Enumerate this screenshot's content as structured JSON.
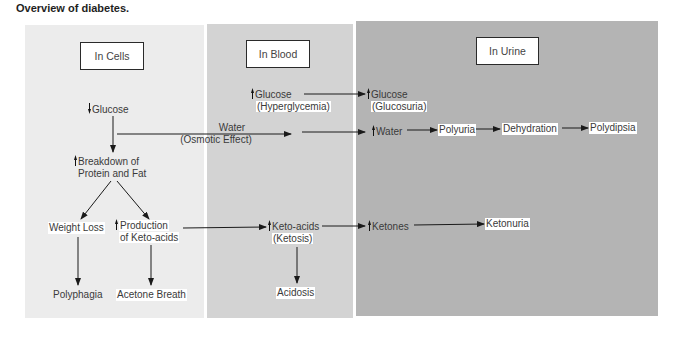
{
  "title": "Overview of diabetes.",
  "colors": {
    "cells_bg": "#ececec",
    "blood_bg": "#d3d3d3",
    "urine_bg": "#b4b4b4",
    "ink": "#1a1a1a"
  },
  "panels": {
    "cells": {
      "header": "In Cells"
    },
    "blood": {
      "header": "In Blood"
    },
    "urine": {
      "header": "In Urine"
    }
  },
  "nodes": {
    "cells_glucose": {
      "text": "Glucose",
      "indicator": "decrease"
    },
    "breakdown": {
      "line1": "Breakdown of",
      "line2": "Protein and Fat",
      "indicator": "increase"
    },
    "water_osmotic": {
      "line1": "Water",
      "line2": "(Osmotic Effect)"
    },
    "weight_loss": {
      "text": "Weight Loss"
    },
    "production": {
      "line1": "Production",
      "line2": "of Keto-acids",
      "indicator": "increase"
    },
    "polyphagia": {
      "text": "Polyphagia"
    },
    "acetone": {
      "text": "Acetone Breath"
    },
    "blood_glucose": {
      "line1": "Glucose",
      "line2": "(Hyperglycemia)",
      "indicator": "increase"
    },
    "keto_acids": {
      "line1": "Keto-acids",
      "line2": "(Ketosis)",
      "indicator": "increase"
    },
    "acidosis": {
      "text": "Acidosis"
    },
    "urine_glucose": {
      "line1": "Glucose",
      "line2": "(Glucosuria)",
      "indicator": "increase"
    },
    "urine_water": {
      "text": "Water",
      "indicator": "increase"
    },
    "polyuria": {
      "text": "Polyuria"
    },
    "dehydration": {
      "text": "Dehydration"
    },
    "polydipsia": {
      "text": "Polydipsia"
    },
    "ketones": {
      "text": "Ketones",
      "indicator": "increase"
    },
    "ketonuria": {
      "text": "Ketonuria"
    }
  }
}
